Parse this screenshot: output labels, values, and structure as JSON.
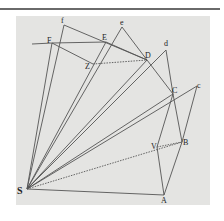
{
  "figure": {
    "colors": {
      "background": "#ffffff",
      "panel": "#e4e4e2",
      "line": "#555555",
      "rule": "#6a6a6a"
    },
    "points": {
      "S": {
        "label": "S",
        "x": 27,
        "y": 189
      },
      "A": {
        "label": "A",
        "x": 164,
        "y": 195
      },
      "B": {
        "label": "B",
        "x": 182,
        "y": 142
      },
      "C": {
        "label": "C",
        "x": 173,
        "y": 94
      },
      "c": {
        "label": "c",
        "x": 197,
        "y": 86
      },
      "D": {
        "label": "D",
        "x": 147,
        "y": 60
      },
      "d": {
        "label": "d",
        "x": 166,
        "y": 50
      },
      "E": {
        "label": "E",
        "x": 106,
        "y": 42
      },
      "e": {
        "label": "e",
        "x": 122,
        "y": 27
      },
      "F": {
        "label": "F",
        "x": 52,
        "y": 43
      },
      "f": {
        "label": "f",
        "x": 64,
        "y": 25
      },
      "Z": {
        "label": "Z",
        "x": 93,
        "y": 64
      },
      "V": {
        "label": "V",
        "x": 157,
        "y": 147
      }
    }
  }
}
